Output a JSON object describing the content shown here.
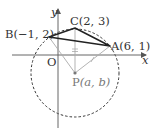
{
  "diagram": {
    "axes": {
      "x_label": "x",
      "y_label": "y",
      "origin_label": "O"
    },
    "points": {
      "A": {
        "label": "A(6, 1)",
        "x": 6,
        "y": 1
      },
      "B": {
        "label": "B(−1, 2)",
        "x": -1,
        "y": 2
      },
      "C": {
        "label": "C(2, 3)",
        "x": 2,
        "y": 3
      },
      "P": {
        "label": "P(a, b)",
        "name": "P",
        "coords": "(a, b)"
      }
    },
    "shapes": {
      "triangle": "ABC",
      "circle": "circumcircle centered at P through A, B, C (dashed)",
      "segments_from_center": [
        "PA",
        "PB",
        "PC"
      ]
    },
    "colors": {
      "triangle": "#222222",
      "circle": "#333333",
      "radii": "#aaaaaa",
      "axes": "#555555"
    }
  }
}
